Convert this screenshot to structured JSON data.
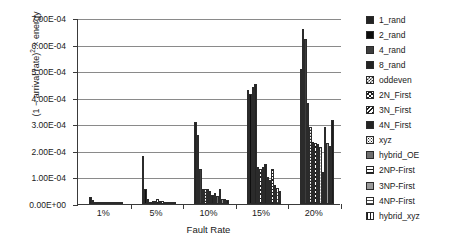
{
  "chart_data": {
    "type": "bar",
    "title": "",
    "subtitle": "",
    "xlabel": "Fault Rate",
    "ylabel": "(1 − arrival rate)² × energy",
    "ylabel_parts": {
      "pre": "(1 − arrival rate)",
      "sup": "2",
      "post": " × energy"
    },
    "grid": true,
    "legend_position": "right",
    "ylim": [
      0,
      0.0007
    ],
    "ytick_values": [
      0,
      0.0001,
      0.0002,
      0.0003,
      0.0004,
      0.0005,
      0.0006,
      0.0007
    ],
    "ytick_labels": [
      "0.00E+00",
      "1.00E-04",
      "2.00E-04",
      "3.00E-04",
      "4.00E-04",
      "5.00E-04",
      "6.00E-04",
      "7.00E-04"
    ],
    "categories": [
      "1%",
      "5%",
      "10%",
      "15%",
      "20%"
    ],
    "series": [
      {
        "name": "1_rand",
        "fill": "f-solid-dark",
        "values": [
          2.5e-05,
          0.00018,
          0.00031,
          0.00043,
          0.00051
        ]
      },
      {
        "name": "2_rand",
        "fill": "f-solid-black",
        "values": [
          1.5e-05,
          5.5e-05,
          0.00026,
          0.000415,
          0.00066
        ]
      },
      {
        "name": "4_rand",
        "fill": "f-solid-mid",
        "values": [
          4e-06,
          2e-05,
          0.00013,
          0.00044,
          0.00062
        ]
      },
      {
        "name": "8_rand",
        "fill": "f-solid-dark",
        "values": [
          3e-06,
          8e-06,
          5.5e-05,
          0.00045,
          0.00038
        ]
      },
      {
        "name": "oddeven",
        "fill": "f-checker",
        "values": [
          2e-06,
          1.3e-05,
          5.6e-05,
          0.00014,
          0.00029
        ]
      },
      {
        "name": "2N_First",
        "fill": "f-cross",
        "values": [
          2e-06,
          1.1e-05,
          5.5e-05,
          0.00013,
          0.000235
        ]
      },
      {
        "name": "3N_First",
        "fill": "f-diag-back",
        "values": [
          1.5e-06,
          1.7e-05,
          5e-05,
          0.00014,
          0.00023
        ]
      },
      {
        "name": "4N_First",
        "fill": "f-solid-dark",
        "values": [
          1.5e-06,
          1.2e-05,
          3.5e-05,
          0.00015,
          0.000225
        ]
      },
      {
        "name": "xyz",
        "fill": "f-dots",
        "values": [
          1e-06,
          1e-05,
          4e-05,
          0.0001,
          0.000215
        ]
      },
      {
        "name": "hybrid_OE",
        "fill": "f-solid-gray",
        "values": [
          1e-06,
          6e-06,
          3e-05,
          9e-05,
          0.00012
        ]
      },
      {
        "name": "2NP-First",
        "fill": "f-hgrid",
        "values": [
          1.5e-06,
          9e-06,
          5.5e-05,
          0.00013,
          0.00029
        ]
      },
      {
        "name": "3NP-First",
        "fill": "f-solid-lgray",
        "values": [
          1e-06,
          5e-06,
          2e-05,
          7e-05,
          0.00023
        ]
      },
      {
        "name": "4NP-First",
        "fill": "f-hgrid-lite",
        "values": [
          8e-07,
          4e-06,
          1.8e-05,
          6e-05,
          0.00022
        ]
      },
      {
        "name": "hybrid_xyz",
        "fill": "f-vgrid",
        "values": [
          8e-07,
          3e-06,
          1.5e-05,
          5e-05,
          0.000315
        ]
      }
    ]
  }
}
